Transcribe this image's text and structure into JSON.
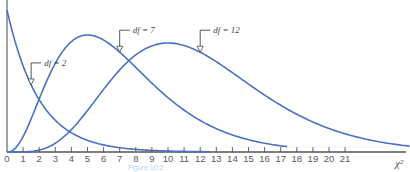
{
  "chart_data": {
    "type": "line",
    "title": "",
    "xlabel": "χ²",
    "ylabel": "",
    "xlim": [
      0,
      25
    ],
    "x_ticks": [
      0,
      1,
      2,
      3,
      4,
      5,
      6,
      7,
      8,
      9,
      10,
      11,
      12,
      13,
      14,
      15,
      16,
      17,
      18,
      19,
      20,
      21
    ],
    "grid": false,
    "series": [
      {
        "name": "df = 2",
        "df": 2,
        "x_range": [
          0,
          12.6
        ],
        "annotation_at_x": 1.5
      },
      {
        "name": "df = 7",
        "df": 7,
        "x_range": [
          0,
          17.4
        ],
        "annotation_at_x": 7
      },
      {
        "name": "df = 12",
        "df": 12,
        "x_range": [
          0,
          25
        ],
        "annotation_at_x": 12
      }
    ],
    "line_color": "#4a72c0",
    "axis_color": "#555555",
    "caption": "Figure 10.2"
  }
}
